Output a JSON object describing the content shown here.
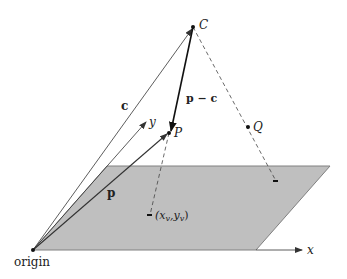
{
  "diagram": {
    "type": "3d-projection-geometry",
    "colors": {
      "plane_fill": "#bfbfbf",
      "plane_stroke": "#808080",
      "line": "#333333",
      "background": "#ffffff"
    },
    "labels": {
      "C": "C",
      "P": "P",
      "Q": "Q",
      "y": "y",
      "x": "x",
      "c": "c",
      "p": "p",
      "p_minus_c": "p − c",
      "projection": "(x",
      "projection_sub_v1": "v",
      "projection_comma": ",y",
      "projection_sub_v2": "v",
      "projection_close": ")",
      "origin": "origin"
    },
    "points": {
      "origin": [
        33,
        250
      ],
      "C": [
        193,
        27
      ],
      "P": [
        169,
        133
      ],
      "Q": [
        248,
        127
      ],
      "P_projection": [
        150,
        215
      ],
      "Q_projection": [
        276,
        181
      ],
      "y_axis_tip": [
        146,
        122
      ],
      "x_axis_tip": [
        302,
        250
      ]
    },
    "plane": {
      "corners": [
        [
          107,
          166
        ],
        [
          330,
          166
        ],
        [
          256,
          250
        ],
        [
          33,
          250
        ]
      ]
    },
    "vectors": [
      {
        "name": "c",
        "from": "origin",
        "to": "C",
        "style": "solid-arrow"
      },
      {
        "name": "p",
        "from": "origin",
        "to": "P",
        "style": "solid-arrow"
      },
      {
        "name": "p − c",
        "from": "C",
        "to": "P",
        "style": "bold-arrow"
      },
      {
        "name": "y-axis",
        "from": "origin",
        "to": "y_axis_tip",
        "style": "solid-arrow"
      },
      {
        "name": "x-axis",
        "from": "plane-bottom-right",
        "to": "x_axis_tip",
        "style": "solid-arrow"
      }
    ],
    "projections": [
      {
        "from": "C",
        "through": "P",
        "to": "P_projection",
        "style": "dashed"
      },
      {
        "from": "C",
        "through": "Q",
        "to": "Q_projection",
        "style": "dashed"
      }
    ]
  }
}
